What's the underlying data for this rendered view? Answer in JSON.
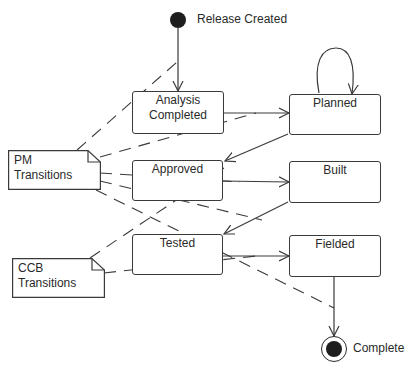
{
  "diagram": {
    "type": "UML state diagram",
    "initial_state": {
      "label": "Release Created"
    },
    "final_state": {
      "label": "Complete"
    },
    "states": [
      {
        "id": "analysis",
        "label_line1": "Analysis",
        "label_line2": "Completed"
      },
      {
        "id": "planned",
        "label": "Planned"
      },
      {
        "id": "approved",
        "label": "Approved"
      },
      {
        "id": "built",
        "label": "Built"
      },
      {
        "id": "tested",
        "label": "Tested"
      },
      {
        "id": "fielded",
        "label": "Fielded"
      }
    ],
    "notes": [
      {
        "id": "pm",
        "line1": "PM",
        "line2": "Transitions"
      },
      {
        "id": "ccb",
        "line1": "CCB",
        "line2": "Transitions"
      }
    ],
    "transitions": [
      {
        "from": "Release Created",
        "to": "Analysis Completed"
      },
      {
        "from": "Analysis Completed",
        "to": "Planned"
      },
      {
        "from": "Planned",
        "to": "Planned"
      },
      {
        "from": "Planned",
        "to": "Approved"
      },
      {
        "from": "Approved",
        "to": "Built"
      },
      {
        "from": "Built",
        "to": "Tested"
      },
      {
        "from": "Tested",
        "to": "Fielded"
      },
      {
        "from": "Fielded",
        "to": "Complete"
      }
    ],
    "note_links": [
      {
        "note": "PM Transitions",
        "targets": [
          "Release Created→Analysis Completed",
          "Analysis Completed→Planned",
          "Approved→Built",
          "Built→Tested",
          "Fielded→Complete"
        ]
      },
      {
        "note": "CCB Transitions",
        "targets": [
          "Planned→Approved",
          "Tested→Fielded"
        ]
      }
    ],
    "colors": {
      "line": "#3a3a3a",
      "fill": "#ffffff",
      "node": "#1e1e1e"
    }
  }
}
